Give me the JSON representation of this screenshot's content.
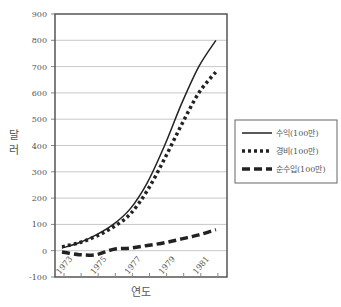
{
  "chart_data": {
    "type": "line",
    "title": "",
    "xlabel": "연도",
    "ylabel": "달러",
    "x": [
      1973,
      1974,
      1975,
      1976,
      1977,
      1978,
      1979,
      1980,
      1981,
      1982
    ],
    "x_tick_labels": [
      "1973",
      "1975",
      "1977",
      "1979",
      "1981"
    ],
    "y_tick_labels": [
      "900",
      "800",
      "700",
      "600",
      "500",
      "400",
      "300",
      "200",
      "100",
      "0",
      "-100"
    ],
    "ylim": [
      -100,
      900
    ],
    "grid": true,
    "legend_position": "right",
    "series": [
      {
        "name": "수익(100만)",
        "style": "solid",
        "values": [
          10,
          30,
          60,
          100,
          160,
          260,
          400,
          560,
          700,
          800
        ]
      },
      {
        "name": "경비(100만)",
        "style": "dotted",
        "values": [
          15,
          30,
          55,
          90,
          140,
          230,
          350,
          480,
          600,
          680
        ]
      },
      {
        "name": "순수입(100만)",
        "style": "dashed",
        "values": [
          -5,
          -15,
          -15,
          5,
          10,
          20,
          30,
          45,
          60,
          80
        ]
      }
    ]
  }
}
